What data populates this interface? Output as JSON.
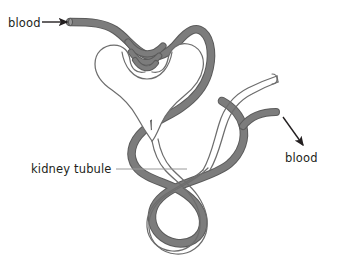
{
  "figure": {
    "kind": "biology-diagram",
    "background_color": "#ffffff"
  },
  "colors": {
    "blood_vessel_fill": "#7c7c7c",
    "blood_vessel_outline": "#5b5b5b",
    "tubule_fill": "#ffffff",
    "tubule_outline": "#6d6d6d",
    "label_text": "#231f20",
    "leader_line": "#9a9a9a",
    "arrow": "#231f20"
  },
  "labels": {
    "blood_in": {
      "text": "blood",
      "x": 8,
      "y": 27,
      "arrow_from_x": 42,
      "arrow_from_y": 22,
      "arrow_to_x": 69,
      "arrow_to_y": 22
    },
    "blood_out": {
      "text": "blood",
      "x": 285,
      "y": 162,
      "arrow_from_x": 283,
      "arrow_from_y": 117,
      "arrow_to_x": 305,
      "arrow_to_y": 147
    },
    "kidney_tubule": {
      "text": "kidney tubule",
      "x": 31,
      "y": 173,
      "leader_from_x": 116,
      "leader_from_y": 169,
      "leader_to_x": 187,
      "leader_to_y": 169
    }
  },
  "structures": [
    {
      "name": "afferent-and-efferent-blood-vessel",
      "description": "grey blood vessel entering top-left, forming glomerulus knot, then spiralling down around the tubule and exiting lower right",
      "color": "#7c7c7c"
    },
    {
      "name": "bowmans-capsule-and-tubule",
      "description": "white kidney tubule forming Bowman's capsule cup and convoluted loop of Henle",
      "color": "#ffffff"
    },
    {
      "name": "collecting-duct",
      "description": "white tube curving up to the right with open cut end",
      "color": "#ffffff"
    }
  ]
}
